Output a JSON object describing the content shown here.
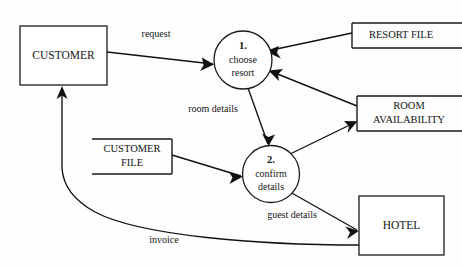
{
  "diagram": {
    "type": "data-flow-diagram",
    "background_color": "#fefefe",
    "line_color": "#1a1a1a",
    "text_color": "#141414",
    "external_entities": [
      {
        "id": "customer",
        "label": "CUSTOMER"
      },
      {
        "id": "hotel",
        "label": "HOTEL"
      }
    ],
    "processes": [
      {
        "id": "p1",
        "number": "1.",
        "line1": "choose",
        "line2": "resort"
      },
      {
        "id": "p2",
        "number": "2.",
        "line1": "confirm",
        "line2": "details"
      }
    ],
    "data_stores": [
      {
        "id": "resort_file",
        "line1": "RESORT FILE",
        "line2": ""
      },
      {
        "id": "room_availability",
        "line1": "ROOM",
        "line2": "AVAILABILITY"
      },
      {
        "id": "customer_file",
        "line1": "CUSTOMER",
        "line2": "FILE"
      }
    ],
    "flows": [
      {
        "id": "f_request",
        "label": "request",
        "from": "customer",
        "to": "p1"
      },
      {
        "id": "f_resort_file",
        "label": "",
        "from": "resort_file",
        "to": "p1"
      },
      {
        "id": "f_room_avail_in",
        "label": "",
        "from": "room_availability",
        "to": "p1"
      },
      {
        "id": "f_room_details",
        "label": "room details",
        "from": "p1",
        "to": "p2"
      },
      {
        "id": "f_customer_file",
        "label": "",
        "from": "customer_file",
        "to": "p2"
      },
      {
        "id": "f_room_avail_out",
        "label": "",
        "from": "p2",
        "to": "room_availability"
      },
      {
        "id": "f_guest_details",
        "label": "guest details",
        "from": "p2",
        "to": "hotel"
      },
      {
        "id": "f_invoice",
        "label": "invoice",
        "from": "hotel",
        "to": "customer"
      }
    ]
  }
}
